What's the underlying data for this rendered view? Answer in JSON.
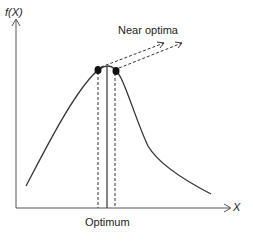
{
  "diagram": {
    "title": "",
    "y_axis_label": "f(X)",
    "x_axis_label": "X",
    "annotations": {
      "near_optima": "Near optima",
      "optimum": "Optimum"
    },
    "colors": {
      "line": "#333333",
      "dot": "#111111",
      "background": "#ffffff"
    },
    "elements": [
      {
        "type": "curve",
        "description": "unimodal function f(X), rising steeply then falling with long tail"
      },
      {
        "type": "point",
        "name": "near-optimum-left"
      },
      {
        "type": "point",
        "name": "near-optimum-right"
      },
      {
        "type": "line",
        "name": "optimum-line",
        "style": "solid"
      },
      {
        "type": "line",
        "name": "near-optimum-dashed-lines",
        "style": "dashed"
      },
      {
        "type": "arrow",
        "name": "near-optima-arrows",
        "style": "dashed"
      }
    ]
  }
}
